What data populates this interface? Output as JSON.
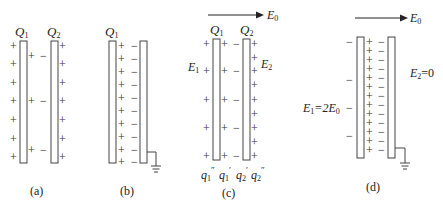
{
  "panels": [
    {
      "id": "a",
      "caption": "(a)",
      "plate1_label": "Q",
      "plate1_sub": "1",
      "plate2_label": "Q",
      "plate2_sub": "2"
    },
    {
      "id": "b",
      "caption": "(b)",
      "plate1_label": "Q",
      "plate1_sub": "1"
    },
    {
      "id": "c",
      "caption": "(c)",
      "plate1_label": "Q",
      "plate1_sub": "1",
      "plate2_label": "Q",
      "plate2_sub": "2",
      "field_label": "E",
      "field_sub": "0",
      "e1_label": "E",
      "e1_sub": "1",
      "e2_label": "E",
      "e2_sub": "2",
      "charges": [
        "q",
        "q",
        "q",
        "q"
      ],
      "charge_subs": [
        "1",
        "1",
        "2",
        "2"
      ],
      "charge_primes": [
        "″",
        "′",
        "′",
        "″"
      ]
    },
    {
      "id": "d",
      "caption": "(d)",
      "field_label": "E",
      "field_sub": "0",
      "e1_text": "E",
      "e1_sub": "1",
      "e1_eq": "=2E",
      "e1_eq_sub": "0",
      "e2_text": "E",
      "e2_sub": "2",
      "e2_eq": "=0"
    }
  ],
  "symbols": {
    "plus": "+",
    "minus": "−"
  }
}
